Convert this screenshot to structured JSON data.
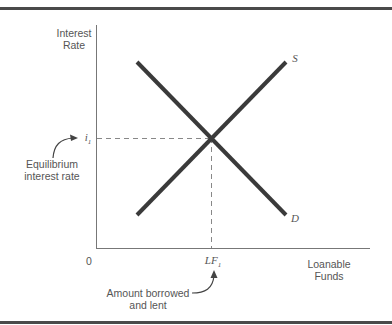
{
  "diagram": {
    "y_axis_label_line1": "Interest",
    "y_axis_label_line2": "Rate",
    "x_axis_label_line1": "Loanable",
    "x_axis_label_line2": "Funds",
    "origin_label": "0",
    "supply_label": "S",
    "demand_label": "D",
    "rate_tick_label": "i",
    "rate_tick_sub": "1",
    "quantity_tick_label": "LF",
    "quantity_tick_sub": "1",
    "annotation_rate_line1": "Equilibrium",
    "annotation_rate_line2": "interest rate",
    "annotation_quantity_line1": "Amount borrowed",
    "annotation_quantity_line2": "and lent"
  },
  "colors": {
    "curve": "#3a3a3a",
    "axis": "#777777",
    "dashed": "#888888",
    "text": "#555555",
    "rule": "#4a4a4a"
  }
}
